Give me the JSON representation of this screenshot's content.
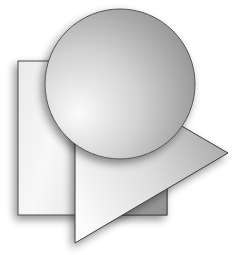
{
  "illustration": {
    "description": "Stacked geometric shapes: rectangle, triangle and circle with grayscale gradients and soft drop shadows",
    "background_color": "#ffffff",
    "stroke_color": "#4a4a4a",
    "shapes": {
      "rectangle": {
        "x": 18,
        "y": 61,
        "width": 149,
        "height": 154,
        "fill_light": "#f7f7f7",
        "fill_dark": "#d6d6d6",
        "covered_fill": "#9e9e9e"
      },
      "triangle": {
        "points": [
          [
            75,
            64
          ],
          [
            228,
            153
          ],
          [
            75,
            243
          ]
        ],
        "fill_light": "#fbfbfb",
        "fill_dark": "#a9a9a9"
      },
      "circle": {
        "cx": 120,
        "cy": 84,
        "r": 75,
        "fill_light": "#f5f5f5",
        "fill_dark": "#8e8e8e"
      }
    }
  }
}
